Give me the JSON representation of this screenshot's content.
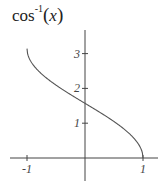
{
  "chart_data": {
    "type": "line",
    "title_parts": {
      "base": "cos",
      "sup": "-1",
      "open": "(",
      "arg": "x",
      "close": ")"
    },
    "xlabel": "",
    "ylabel": "",
    "xlim": [
      -1.2,
      1.2
    ],
    "ylim": [
      -0.8,
      3.6
    ],
    "x_ticks": [
      -1,
      1
    ],
    "x_tick_labels": [
      "-1",
      "1"
    ],
    "y_ticks": [
      1,
      2,
      3
    ],
    "y_tick_labels": [
      "1",
      "2",
      "3"
    ],
    "grid": false,
    "legend": null,
    "series": [
      {
        "name": "arccos(x)",
        "function": "arccos",
        "x": [
          -1,
          -0.9,
          -0.75,
          -0.5,
          -0.25,
          0,
          0.25,
          0.5,
          0.75,
          0.9,
          1
        ],
        "values": [
          3.14,
          2.69,
          2.42,
          2.09,
          1.82,
          1.57,
          1.32,
          1.05,
          0.72,
          0.45,
          0
        ]
      }
    ],
    "colors": {
      "curve": "#555555",
      "axes": "#444444"
    }
  }
}
